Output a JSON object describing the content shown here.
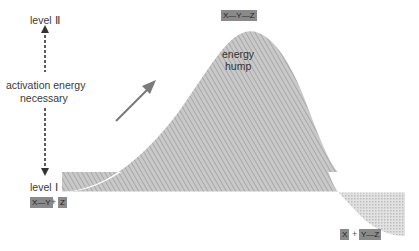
{
  "diagram": {
    "type": "energy-profile",
    "levels": {
      "upper": "level Ⅱ",
      "lower": "level Ⅰ"
    },
    "activation_label": [
      "activation energy",
      "necessary"
    ],
    "hump_label": [
      "energy",
      "hump"
    ],
    "states": {
      "reactants": {
        "left": "X—Y",
        "plus": "+",
        "right": "Z"
      },
      "transition": "X—Y—Z",
      "products": {
        "left": "X",
        "plus": "+",
        "right": "Y—Z"
      }
    },
    "colors": {
      "hump_fill": "#b8b8b8",
      "product_fill": "#d4d4d4",
      "box": "#8a8a8a",
      "arrow": "#7a7a7a",
      "text": "#3a3a3a"
    }
  }
}
